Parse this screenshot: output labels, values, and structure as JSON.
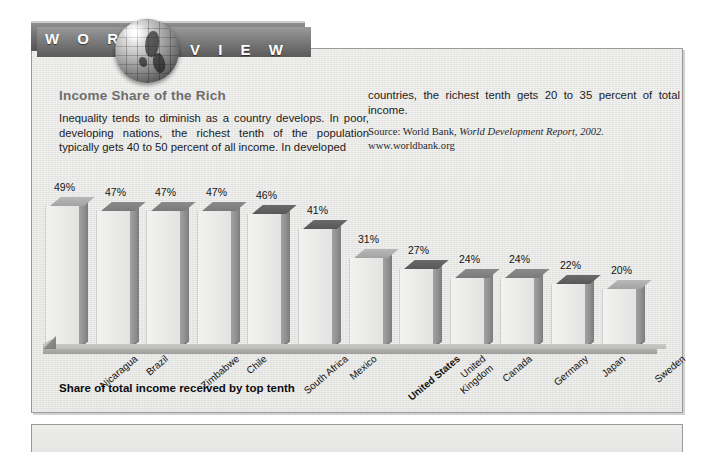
{
  "banner": {
    "word_left": "W O R L D",
    "word_right": "V I E W",
    "globe_icon": "globe-icon"
  },
  "figure": {
    "title": "Income Share of the Rich",
    "body_left": "Inequality tends to diminish as a country develops. In poor, developing nations, the richest tenth of the population typically gets 40 to 50 percent of all income. In developed",
    "body_right": "countries, the richest tenth gets 20 to 35 percent of total income.",
    "source_prefix": "Source: World Bank, ",
    "source_italic": "World Development Report, 2002.",
    "source_url": "www.worldbank.org",
    "caption": "Share of total income received by top tenth"
  },
  "chart_data": {
    "type": "bar",
    "title": "Income Share of the Rich",
    "xlabel": "",
    "ylabel": "",
    "ylim": [
      0,
      52
    ],
    "grid": false,
    "legend": "none",
    "value_suffix": "%",
    "categories": [
      "Nicaragua",
      "Brazil",
      "Zimbabwe",
      "Chile",
      "South Africa",
      "Mexico",
      "United States",
      "United Kingdom",
      "Canada",
      "Germany",
      "Japan",
      "Sweden"
    ],
    "values": [
      49,
      47,
      47,
      47,
      46,
      41,
      31,
      27,
      24,
      24,
      22,
      20
    ],
    "labels": [
      "49%",
      "47%",
      "47%",
      "47%",
      "46%",
      "41%",
      "31%",
      "27%",
      "24%",
      "24%",
      "22%",
      "20%"
    ],
    "highlight": "United States"
  },
  "colors": {
    "banner": "#6a6a6a",
    "panel_bg": "#e7e7e5",
    "panel_border": "#9a9a9a",
    "title_gray": "#6e6e6e",
    "bar_front": "#ebebe9",
    "bar_side": "#8e8e8e",
    "bar_top": "#7a7a7a"
  }
}
